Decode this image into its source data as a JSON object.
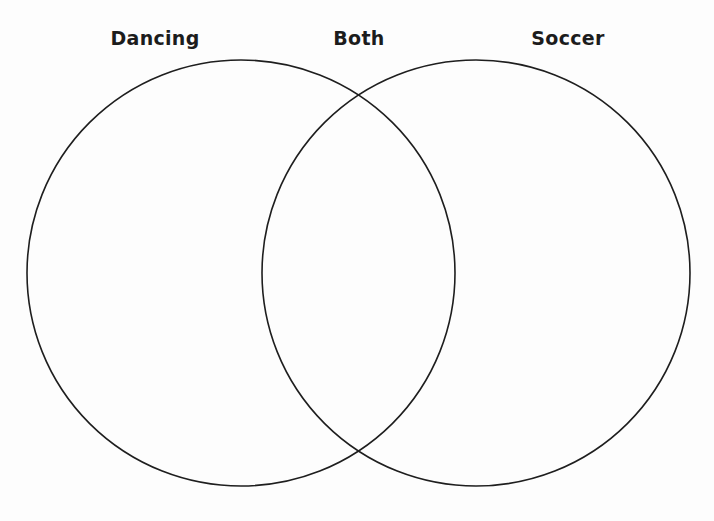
{
  "diagram": {
    "type": "venn",
    "labels": {
      "left": "Dancing",
      "center": "Both",
      "right": "Soccer"
    },
    "sets": [
      {
        "name": "Dancing",
        "cx": 241,
        "cy": 273,
        "rx": 214,
        "ry": 213
      },
      {
        "name": "Soccer",
        "cx": 476,
        "cy": 273,
        "rx": 214,
        "ry": 213
      }
    ],
    "colors": {
      "stroke": "#1e1e1e",
      "text": "#1c1c1c",
      "background": "#fdfdfd"
    }
  }
}
